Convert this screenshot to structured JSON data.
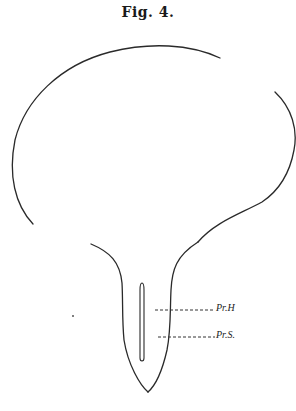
{
  "figure": {
    "title": "Fig. 4.",
    "labels": [
      {
        "id": "pr-h",
        "text": "Pr.H"
      },
      {
        "id": "pr-s",
        "text": "Pr.S."
      }
    ],
    "colors": {
      "ink": "#2a2a2a",
      "background": "#ffffff"
    }
  }
}
